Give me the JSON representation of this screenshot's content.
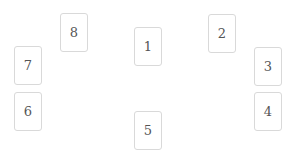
{
  "layout": {
    "type": "card-spread",
    "cards": [
      {
        "label": "1",
        "x": 134,
        "y": 27
      },
      {
        "label": "2",
        "x": 208,
        "y": 14
      },
      {
        "label": "3",
        "x": 254,
        "y": 47
      },
      {
        "label": "4",
        "x": 254,
        "y": 92
      },
      {
        "label": "5",
        "x": 134,
        "y": 111
      },
      {
        "label": "6",
        "x": 14,
        "y": 92
      },
      {
        "label": "7",
        "x": 14,
        "y": 46
      },
      {
        "label": "8",
        "x": 60,
        "y": 13
      }
    ]
  },
  "colors": {
    "background": "#ffffff",
    "card_border": "#d9d9d9",
    "card_text": "#555555"
  }
}
